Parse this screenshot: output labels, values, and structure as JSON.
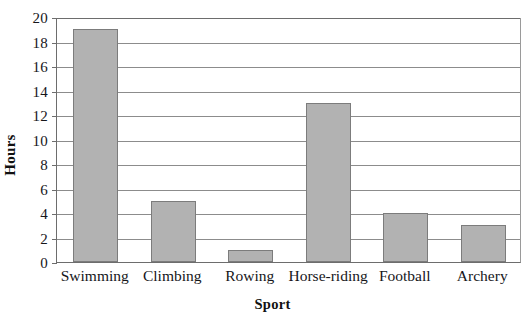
{
  "chart_data": {
    "type": "bar",
    "title": "",
    "xlabel": "Sport",
    "ylabel": "Hours",
    "categories": [
      "Swimming",
      "Climbing",
      "Rowing",
      "Horse-riding",
      "Football",
      "Archery"
    ],
    "values": [
      19,
      5,
      1,
      13,
      4,
      3
    ],
    "ylim": [
      0,
      20
    ],
    "ytick_step": 2,
    "ytick_labels": [
      "0",
      "2",
      "4",
      "6",
      "8",
      "10",
      "12",
      "14",
      "16",
      "18",
      "20"
    ],
    "grid": true,
    "legend": false,
    "series": [
      {
        "name": "Hours",
        "values": [
          19,
          5,
          1,
          13,
          4,
          3
        ]
      }
    ],
    "colors": {
      "bar_fill": "#b2b2b2",
      "bar_stroke": "#7c7c7c",
      "gridline": "#8c8c8c",
      "axis": "#6d6d6d",
      "text": "#16161a",
      "background": "#ffffff"
    }
  }
}
